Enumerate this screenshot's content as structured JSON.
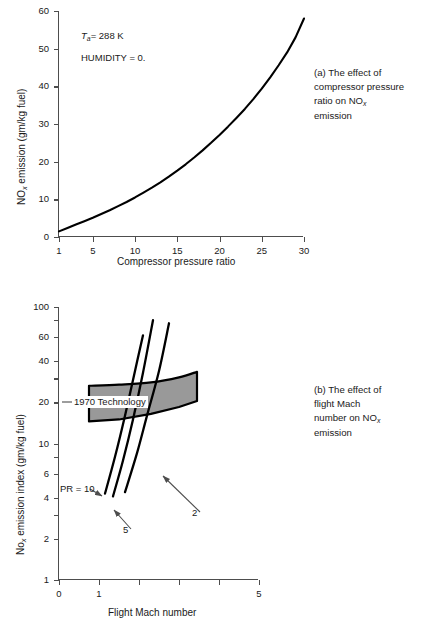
{
  "figure": {
    "panels": [
      {
        "id": "a",
        "caption_lines": [
          "(a) The effect of",
          "compressor pressure",
          "ratio on NO",
          "emission"
        ],
        "caption_sub": "x",
        "xlabel": "Compressor pressure ratio",
        "ylabel_pre": "NO",
        "ylabel_sub": "x",
        "ylabel_post": " emission (gm/kg fuel)",
        "annotations": [
          {
            "pre": "T",
            "sub": "a",
            "post": "= 288 K"
          },
          {
            "text": "HUMIDITY = 0."
          }
        ]
      },
      {
        "id": "b",
        "caption_lines": [
          "(b) The effect of",
          "flight Mach",
          "number on NO",
          "emission"
        ],
        "caption_sub": "x",
        "xlabel": "Flight Mach number",
        "ylabel_pre": "No",
        "ylabel_sub": "x",
        "ylabel_post": " emission index (gm/kg fuel)",
        "band_label": "1970 Technology",
        "curve_labels": [
          {
            "text": "PR = 10"
          },
          {
            "text": "5"
          },
          {
            "text": "2"
          }
        ]
      }
    ]
  },
  "chart_data": [
    {
      "type": "line",
      "panel": "a",
      "title": "",
      "xlabel": "Compressor pressure ratio",
      "ylabel": "NOx emission (gm/kg fuel)",
      "xlim": [
        1,
        30
      ],
      "ylim": [
        0,
        60
      ],
      "xticks": [
        1,
        5,
        10,
        15,
        20,
        25,
        30
      ],
      "xticklabels": [
        "1",
        "5",
        "10",
        "15",
        "20",
        "25",
        "30"
      ],
      "yticks": [
        0,
        10,
        20,
        30,
        40,
        50,
        60
      ],
      "yticklabels": [
        "0",
        "10",
        "20",
        "30",
        "40",
        "50",
        "60"
      ],
      "grid": false,
      "legend": null,
      "annotations": [
        "Ta= 288 K",
        "HUMIDITY = 0."
      ],
      "series": [
        {
          "name": "NOx emission",
          "x": [
            1,
            2,
            3,
            4,
            5,
            6,
            7,
            8,
            9,
            10,
            11,
            12,
            13,
            14,
            15,
            16,
            17,
            18,
            19,
            20,
            21,
            22,
            23,
            24,
            25,
            26,
            27,
            28,
            29,
            30
          ],
          "y": [
            1.5,
            2.4,
            3.3,
            4.2,
            5.1,
            6.1,
            7.1,
            8.2,
            9.3,
            10.5,
            11.8,
            13.1,
            14.5,
            16.0,
            17.6,
            19.3,
            21.1,
            23.0,
            25.0,
            27.1,
            29.3,
            31.6,
            34.0,
            36.6,
            39.4,
            42.4,
            45.6,
            49.0,
            53.0,
            58.0
          ]
        }
      ]
    },
    {
      "type": "line",
      "panel": "b",
      "title": "",
      "xlabel": "Flight Mach number",
      "ylabel": "Nox emission index (gm/kg fuel)",
      "xlim": [
        0,
        5
      ],
      "ylim": [
        1,
        100
      ],
      "yscale": "log",
      "xticks": [
        0,
        1,
        2,
        3,
        4,
        5
      ],
      "xticklabels": [
        "0",
        "1",
        "",
        "",
        "",
        "5"
      ],
      "yticks": [
        1,
        2,
        4,
        6,
        10,
        20,
        40,
        60,
        100
      ],
      "yticklabels": [
        "1",
        "2",
        "4",
        "6",
        "10",
        "20",
        "40",
        "60",
        "100"
      ],
      "grid": false,
      "legend_position": "inline-labels",
      "series": [
        {
          "name": "PR = 10",
          "label": "PR = 10",
          "x": [
            1.15,
            1.4,
            1.65,
            1.9,
            2.1
          ],
          "y": [
            4.3,
            8.0,
            16.0,
            34.0,
            62.0
          ]
        },
        {
          "name": "PR = 5",
          "label": "5",
          "x": [
            1.35,
            1.6,
            1.85,
            2.1,
            2.35
          ],
          "y": [
            4.1,
            7.5,
            15.0,
            33.0,
            80.0
          ]
        },
        {
          "name": "PR = 2",
          "label": "2",
          "x": [
            1.65,
            1.95,
            2.2,
            2.5,
            2.75
          ],
          "y": [
            4.4,
            8.5,
            16.0,
            34.0,
            76.0
          ]
        }
      ],
      "band": {
        "name": "1970 Technology",
        "label": "1970 Technology",
        "fill": "#999999",
        "x": [
          0.75,
          1.5,
          2.3,
          3.0,
          3.45
        ],
        "y_upper": [
          26.5,
          27.0,
          28.0,
          30.5,
          33.5
        ],
        "y_lower": [
          14.5,
          15.0,
          16.5,
          18.5,
          20.5
        ]
      }
    }
  ],
  "colors": {
    "curve": "#000000",
    "axis": "#4d4d4d",
    "text": "#1a1a1a",
    "band_fill": "#999999",
    "arrow": "#4d4d4d",
    "background": "#ffffff"
  }
}
